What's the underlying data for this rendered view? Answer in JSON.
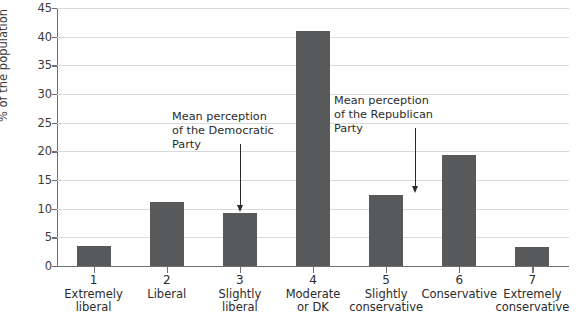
{
  "chart_data": {
    "type": "bar",
    "title": "",
    "subtitle": "",
    "xlabel": "",
    "ylabel": "% of the population",
    "ylim": [
      0,
      45
    ],
    "ytick_step": 5,
    "grid": true,
    "legend": "none",
    "bar_color": "#58595b",
    "gridline_color": "#d9d9d9",
    "axis_color": "#6d6e70",
    "categories": [
      {
        "number": "1",
        "line1": "Extremely",
        "line2": "liberal"
      },
      {
        "number": "2",
        "line1": "Liberal",
        "line2": ""
      },
      {
        "number": "3",
        "line1": "Slightly",
        "line2": "liberal"
      },
      {
        "number": "4",
        "line1": "Moderate",
        "line2": "or DK"
      },
      {
        "number": "5",
        "line1": "Slightly",
        "line2": "conservative"
      },
      {
        "number": "6",
        "line1": "Conservative",
        "line2": ""
      },
      {
        "number": "7",
        "line1": "Extremely",
        "line2": "conservative"
      }
    ],
    "values": [
      3.5,
      11.2,
      9.3,
      41.0,
      12.3,
      19.4,
      3.3
    ],
    "ytick_labels": [
      "0",
      "5",
      "10",
      "15",
      "20",
      "25",
      "30",
      "35",
      "40",
      "45"
    ],
    "ytick_values": [
      0,
      5,
      10,
      15,
      20,
      25,
      30,
      35,
      40,
      45
    ],
    "annotations": [
      {
        "id": "democratic",
        "line1": "Mean perception",
        "line2": "of the Democratic",
        "line3": "Party",
        "points_to_category": "3",
        "points_to_x": 3.0
      },
      {
        "id": "republican",
        "line1": "Mean perception",
        "line2": "of the Republican",
        "line3": "Party",
        "points_to_category": "5",
        "points_to_x": 5.4
      }
    ]
  }
}
